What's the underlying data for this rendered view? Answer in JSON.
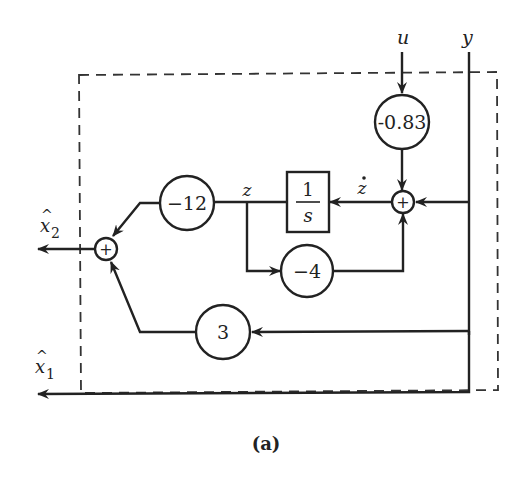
{
  "diagram": {
    "caption": "(a)",
    "inputs": {
      "u": "u",
      "y": "y"
    },
    "outputs": {
      "x2_hat": "x",
      "x2_sub": "2",
      "x1_hat": "x",
      "x1_sub": "1",
      "hat": "^"
    },
    "signals": {
      "z": "z",
      "z_dot": "z"
    },
    "gains": {
      "g_u": "-0.83",
      "g_z_to_x2": "−12",
      "g_z_feedback": "−4",
      "g_y_to_x2": "3"
    },
    "integrator": {
      "numerator": "1",
      "denominator": "s"
    },
    "summers": {
      "sum_symbol": "+"
    }
  }
}
